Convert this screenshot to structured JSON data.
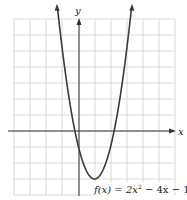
{
  "chart_data": {
    "type": "line",
    "title": "",
    "xlabel": "x",
    "ylabel": "y",
    "xlim": [
      -4,
      6
    ],
    "ylim": [
      -4,
      7
    ],
    "grid": true,
    "grid_step": 1,
    "tick_labels": false,
    "series": [
      {
        "name": "f(x) = 2x^2 - 4x - 1",
        "function": "2*x*x - 4*x - 1",
        "x": [
          -1.35,
          -1,
          -0.5,
          -0.22,
          0,
          0.5,
          1,
          1.5,
          2,
          2.22,
          2.5,
          3,
          3.35
        ],
        "y": [
          7.05,
          5,
          2,
          0,
          -1,
          -2.5,
          -3,
          -2.5,
          -1,
          0,
          1.5,
          5,
          7.05
        ],
        "vertex": [
          1,
          -3
        ],
        "y_intercept": -1,
        "roots": [
          -0.22,
          2.22
        ]
      }
    ],
    "annotations": [
      {
        "text": "f(x) = 2x² − 4x − 1",
        "position": "bottom-right"
      }
    ]
  },
  "labels": {
    "x_axis": "x",
    "y_axis": "y",
    "equation_prefix": "f(x) = 2x",
    "equation_exp": "2",
    "equation_suffix": " − 4x − 1"
  },
  "colors": {
    "grid": "#d0d0d0",
    "axis": "#333333",
    "curve": "#3a3a3a"
  }
}
